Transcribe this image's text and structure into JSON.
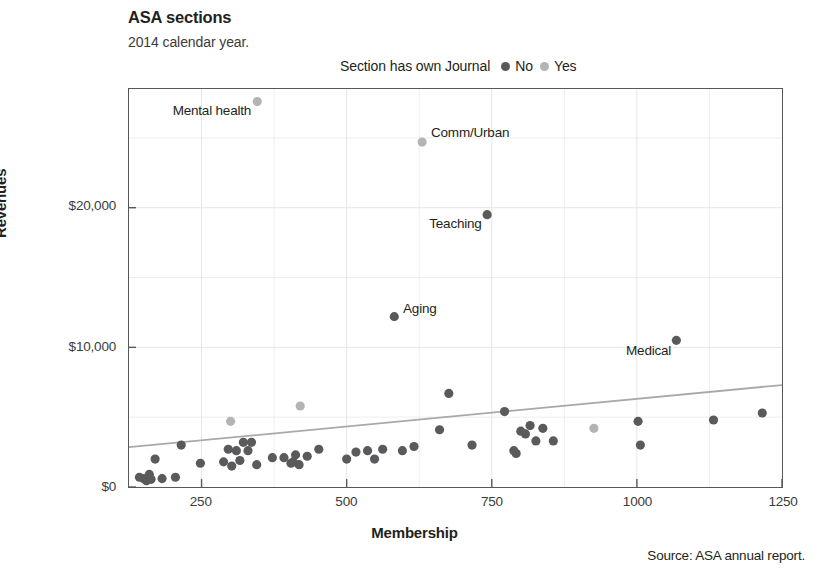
{
  "header": {
    "title": "ASA sections",
    "subtitle": "2014 calendar year."
  },
  "legend": {
    "title": "Section has own Journal",
    "items": [
      {
        "label": "No",
        "color": "#5a5a5c"
      },
      {
        "label": "Yes",
        "color": "#b4b4b6"
      }
    ]
  },
  "source": "Source: ASA annual report.",
  "chart_data": {
    "type": "scatter",
    "title": "ASA sections",
    "subtitle": "2014 calendar year.",
    "xlabel": "Membership",
    "ylabel": "Revenues",
    "xlim": [
      125,
      1250
    ],
    "ylim": [
      0,
      28500
    ],
    "xticks": [
      250,
      500,
      750,
      1000,
      1250
    ],
    "xtick_labels": [
      "250",
      "500",
      "750",
      "1000",
      "1250"
    ],
    "yticks": [
      0,
      10000,
      20000
    ],
    "ytick_labels": [
      "$0",
      "$10,000",
      "$20,000"
    ],
    "grid": "light gridlines; vertical every 125 membership, horizontal every 5000 revenue",
    "legend_position": "above plot, centered",
    "legend_title": "Section has own Journal",
    "colors": {
      "no": "#5a5a5c",
      "yes": "#b4b4b6"
    },
    "trend_line": {
      "label": "linear fit",
      "color": "#a9a9ab",
      "x": [
        125,
        1250
      ],
      "y": [
        2850,
        7300
      ]
    },
    "series": [
      {
        "name": "No",
        "has_own_journal": false,
        "color": "#5a5a5c",
        "points": [
          {
            "x": 143,
            "y": 700
          },
          {
            "x": 150,
            "y": 600
          },
          {
            "x": 155,
            "y": 450
          },
          {
            "x": 160,
            "y": 900
          },
          {
            "x": 163,
            "y": 550
          },
          {
            "x": 170,
            "y": 2000
          },
          {
            "x": 182,
            "y": 600
          },
          {
            "x": 205,
            "y": 700
          },
          {
            "x": 215,
            "y": 3000
          },
          {
            "x": 248,
            "y": 1700
          },
          {
            "x": 288,
            "y": 1800
          },
          {
            "x": 296,
            "y": 2700
          },
          {
            "x": 302,
            "y": 1500
          },
          {
            "x": 310,
            "y": 2600
          },
          {
            "x": 316,
            "y": 1900
          },
          {
            "x": 322,
            "y": 3200
          },
          {
            "x": 330,
            "y": 2600
          },
          {
            "x": 336,
            "y": 3200
          },
          {
            "x": 345,
            "y": 1600
          },
          {
            "x": 372,
            "y": 2100
          },
          {
            "x": 392,
            "y": 2100
          },
          {
            "x": 404,
            "y": 1700
          },
          {
            "x": 408,
            "y": 1800
          },
          {
            "x": 412,
            "y": 2300
          },
          {
            "x": 418,
            "y": 1600
          },
          {
            "x": 432,
            "y": 2200
          },
          {
            "x": 452,
            "y": 2700
          },
          {
            "x": 500,
            "y": 2000
          },
          {
            "x": 516,
            "y": 2500
          },
          {
            "x": 536,
            "y": 2600
          },
          {
            "x": 548,
            "y": 2000
          },
          {
            "x": 562,
            "y": 2700
          },
          {
            "x": 582,
            "y": 12200
          },
          {
            "x": 596,
            "y": 2600
          },
          {
            "x": 616,
            "y": 2900
          },
          {
            "x": 660,
            "y": 4100
          },
          {
            "x": 676,
            "y": 6700
          },
          {
            "x": 716,
            "y": 3000
          },
          {
            "x": 742,
            "y": 19500
          },
          {
            "x": 772,
            "y": 5400
          },
          {
            "x": 788,
            "y": 2600
          },
          {
            "x": 792,
            "y": 2400
          },
          {
            "x": 800,
            "y": 4000
          },
          {
            "x": 808,
            "y": 3800
          },
          {
            "x": 816,
            "y": 4400
          },
          {
            "x": 826,
            "y": 3300
          },
          {
            "x": 838,
            "y": 4200
          },
          {
            "x": 856,
            "y": 3300
          },
          {
            "x": 1002,
            "y": 4700
          },
          {
            "x": 1006,
            "y": 3000
          },
          {
            "x": 1068,
            "y": 10500
          },
          {
            "x": 1132,
            "y": 4800
          },
          {
            "x": 1216,
            "y": 5300
          }
        ]
      },
      {
        "name": "Yes",
        "has_own_journal": true,
        "color": "#b4b4b6",
        "points": [
          {
            "x": 346,
            "y": 27600
          },
          {
            "x": 630,
            "y": 24700
          },
          {
            "x": 300,
            "y": 4700
          },
          {
            "x": 420,
            "y": 5800
          },
          {
            "x": 926,
            "y": 4200
          }
        ]
      }
    ],
    "annotations": [
      {
        "text": "Mental health",
        "x": 346,
        "y": 27600,
        "anchor": "below-left"
      },
      {
        "text": "Comm/Urban",
        "x": 630,
        "y": 24700,
        "anchor": "above-right"
      },
      {
        "text": "Teaching",
        "x": 742,
        "y": 19500,
        "anchor": "below-left"
      },
      {
        "text": "Aging",
        "x": 582,
        "y": 12200,
        "anchor": "above-right"
      },
      {
        "text": "Medical",
        "x": 1068,
        "y": 10500,
        "anchor": "below-left"
      }
    ]
  }
}
